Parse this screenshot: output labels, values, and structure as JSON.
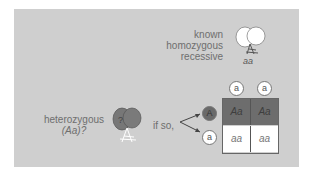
{
  "diagram": {
    "known_parent": {
      "lines": [
        "known",
        "homozygous",
        "recessive"
      ],
      "genotype": "aa"
    },
    "test_parent": {
      "label": "heterozygous",
      "genotype_q": "(Aa)?",
      "mark": "?"
    },
    "if_so": "if so,",
    "gametes_top": [
      "a",
      "a"
    ],
    "gametes_left": [
      "A",
      "a"
    ],
    "punnett": [
      [
        "Aa",
        "Aa"
      ],
      [
        "aa",
        "aa"
      ]
    ],
    "colors": {
      "background": "#cfcfcf",
      "dominant_cell": "#6d6d6d",
      "recessive_cell": "#ffffff"
    }
  }
}
